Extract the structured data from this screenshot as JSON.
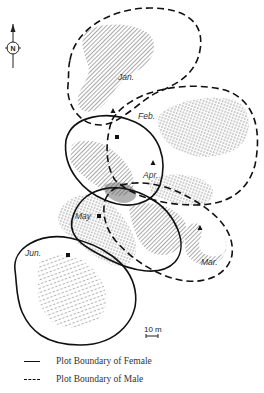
{
  "figure": {
    "type": "home-range map",
    "north_label": "N",
    "scale_label": "10 m",
    "months": [
      {
        "label": "Jan.",
        "boundary": "male",
        "marker": "triangle"
      },
      {
        "label": "Feb.",
        "boundary": "male",
        "marker": "none"
      },
      {
        "label": "Mar.",
        "boundary": "male",
        "marker": "triangle"
      },
      {
        "label": "Apr.",
        "boundary": "female",
        "marker": "triangle"
      },
      {
        "label": "May",
        "boundary": "female",
        "marker": "square"
      },
      {
        "label": "Jun.",
        "boundary": "female",
        "marker": "square"
      }
    ]
  },
  "legend": {
    "female": "Plot Boundary of Female",
    "male": "Plot Boundary of Male"
  },
  "colors": {
    "line": "#111111",
    "hatch": "#555555",
    "background": "#ffffff"
  }
}
